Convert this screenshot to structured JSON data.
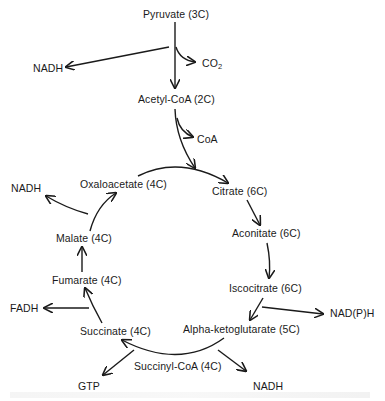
{
  "diagram": {
    "type": "metabolic-pathway",
    "title_visible": false,
    "nodes": {
      "pyruvate": "Pyruvate (3C)",
      "acetyl_coa": "Acetyl-CoA (2C)",
      "citrate": "Citrate (6C)",
      "aconitate": "Aconitate (6C)",
      "iscocitrate": "Iscocitrate (6C)",
      "alpha_ketoglutarate": "Alpha-ketoglutarate (5C)",
      "succinyl_coa": "Succinyl-CoA (4C)",
      "succinate": "Succinate (4C)",
      "fumarate": "Fumarate (4C)",
      "malate": "Malate (4C)",
      "oxaloacetate": "Oxaloacetate (4C)"
    },
    "byproducts": {
      "nadh_pyruvate": "NADH",
      "co2_main": "CO",
      "co2_sub": "2",
      "coa": "CoA",
      "nadph_iscocitrate": "NAD(P)H",
      "nadh_akg": "NADH",
      "gtp": "GTP",
      "fadh": "FADH",
      "nadh_malate": "NADH"
    },
    "edges": [
      {
        "from": "Pyruvate (3C)",
        "to": "Acetyl-CoA (2C)",
        "side_outputs": [
          "NADH",
          "CO2"
        ]
      },
      {
        "from": "Acetyl-CoA (2C)",
        "to": "Citrate (6C)",
        "side_outputs": [
          "CoA"
        ]
      },
      {
        "from": "Oxaloacetate (4C)",
        "to": "Citrate (6C)"
      },
      {
        "from": "Citrate (6C)",
        "to": "Aconitate (6C)"
      },
      {
        "from": "Aconitate (6C)",
        "to": "Iscocitrate (6C)"
      },
      {
        "from": "Iscocitrate (6C)",
        "to": "Alpha-ketoglutarate (5C)",
        "side_outputs": [
          "NAD(P)H"
        ]
      },
      {
        "from": "Alpha-ketoglutarate (5C)",
        "to": "Succinate (4C)",
        "via": "Succinyl-CoA (4C)",
        "side_outputs": [
          "NADH",
          "GTP"
        ]
      },
      {
        "from": "Succinate (4C)",
        "to": "Fumarate (4C)",
        "side_outputs": [
          "FADH"
        ]
      },
      {
        "from": "Fumarate (4C)",
        "to": "Malate (4C)"
      },
      {
        "from": "Malate (4C)",
        "to": "Oxaloacetate (4C)",
        "side_outputs": [
          "NADH"
        ]
      }
    ]
  }
}
